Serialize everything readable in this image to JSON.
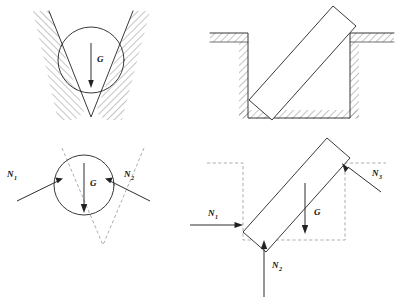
{
  "figure": {
    "background": "#ffffff",
    "ink_color": "#222222",
    "hatch_color": "#3a3a3a",
    "dashed_color": "#8a8a8a",
    "width": 398,
    "height": 300
  },
  "panels": [
    {
      "id": "panel-a",
      "name": "ball-in-v-groove",
      "description": "Sphere resting in a V-shaped groove with hatched walls",
      "labels": [
        "G"
      ]
    },
    {
      "id": "panel-b",
      "name": "ball-free-body-diagram",
      "description": "Free-body diagram of the sphere with two normal reactions and weight",
      "labels": [
        "N1",
        "N2",
        "G"
      ]
    },
    {
      "id": "panel-c",
      "name": "bar-in-trench",
      "description": "Rectangular bar leaning across a hatched rectangular trench",
      "labels": []
    },
    {
      "id": "panel-d",
      "name": "bar-free-body-diagram",
      "description": "Free-body diagram of the bar with three normal reactions and weight",
      "labels": [
        "N1",
        "N2",
        "N3",
        "G"
      ]
    }
  ],
  "labels": {
    "weight": {
      "symbol": "G",
      "subscript": ""
    },
    "normal_1": {
      "symbol": "N",
      "subscript": "1"
    },
    "normal_2": {
      "symbol": "N",
      "subscript": "2"
    },
    "normal_3": {
      "symbol": "N",
      "subscript": "3"
    }
  },
  "panel_a": {
    "weight_label": "G",
    "weight_sub": ""
  },
  "panel_b": {
    "n1_label": "N",
    "n1_sub": "1",
    "n2_label": "N",
    "n2_sub": "2",
    "weight_label": "G",
    "weight_sub": ""
  },
  "panel_d": {
    "n1_label": "N",
    "n1_sub": "1",
    "n2_label": "N",
    "n2_sub": "2",
    "n3_label": "N",
    "n3_sub": "3",
    "weight_label": "G",
    "weight_sub": ""
  }
}
